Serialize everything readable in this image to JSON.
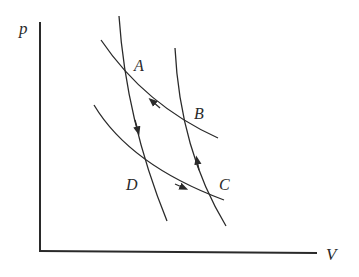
{
  "diagram": {
    "type": "p-V cycle (Carnot-like)",
    "axes": {
      "y_label": "p",
      "x_label": "V"
    },
    "points": [
      {
        "name": "A",
        "label": "A"
      },
      {
        "name": "B",
        "label": "B"
      },
      {
        "name": "C",
        "label": "C"
      },
      {
        "name": "D",
        "label": "D"
      }
    ],
    "curves": [
      {
        "name": "upper-isotherm",
        "through": [
          "A",
          "B"
        ],
        "arrow_direction": "B to A"
      },
      {
        "name": "lower-isotherm",
        "through": [
          "D",
          "C"
        ],
        "arrow_direction": "D to C"
      },
      {
        "name": "left-adiabat",
        "through": [
          "A",
          "D"
        ],
        "arrow_direction": "A to D"
      },
      {
        "name": "right-adiabat",
        "through": [
          "C",
          "B"
        ],
        "arrow_direction": "C to B"
      }
    ],
    "colors": {
      "line": "#2a2a2a",
      "background": "#ffffff"
    }
  }
}
